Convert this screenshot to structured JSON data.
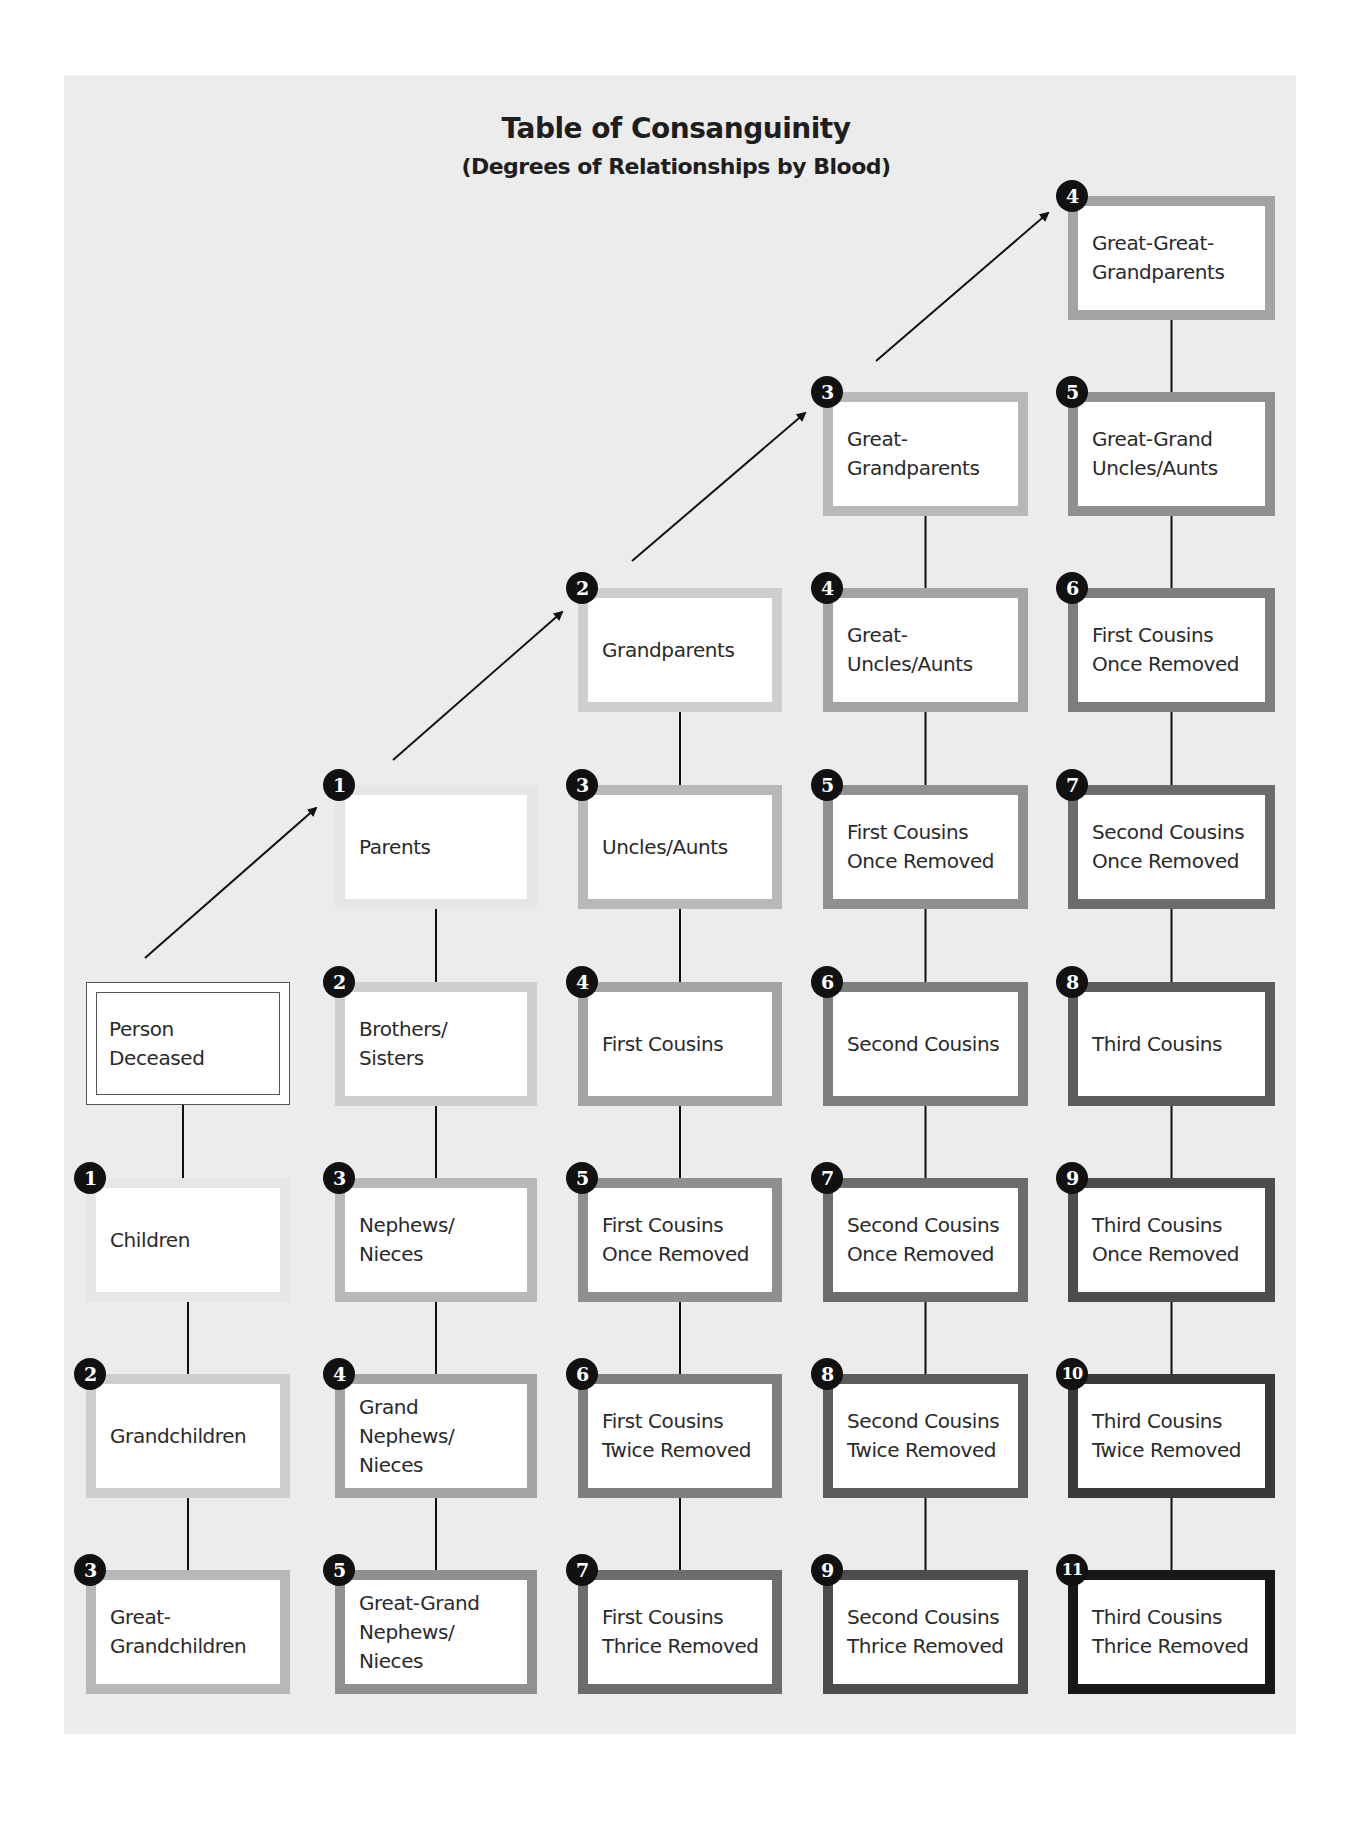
{
  "title": "Table of Consanguinity",
  "subtitle": "(Degrees of Relationships by Blood)",
  "colors": {
    "background": "#ececec",
    "badge": "#111111",
    "degree_shades": {
      "1": "#e6e6e6",
      "2": "#cecece",
      "3": "#b8b8b8",
      "4": "#a4a4a4",
      "5": "#909090",
      "6": "#7e7e7e",
      "7": "#6c6c6c",
      "8": "#5c5c5c",
      "9": "#4c4c4c",
      "10": "#393939",
      "11": "#181818"
    }
  },
  "deceased": {
    "label": "Person\nDeceased"
  },
  "columns": [
    {
      "name": "descendants",
      "nodes": [
        {
          "degree": "1",
          "label": "Children"
        },
        {
          "degree": "2",
          "label": "Grandchildren"
        },
        {
          "degree": "3",
          "label": "Great-\nGrandchildren"
        }
      ]
    },
    {
      "name": "parents-line",
      "nodes": [
        {
          "degree": "1",
          "label": "Parents"
        },
        {
          "degree": "2",
          "label": "Brothers/\nSisters"
        },
        {
          "degree": "3",
          "label": "Nephews/\nNieces"
        },
        {
          "degree": "4",
          "label": "Grand\nNephews/\nNieces"
        },
        {
          "degree": "5",
          "label": "Great-Grand\nNephews/\nNieces"
        }
      ]
    },
    {
      "name": "grandparents-line",
      "nodes": [
        {
          "degree": "2",
          "label": "Grandparents"
        },
        {
          "degree": "3",
          "label": "Uncles/Aunts"
        },
        {
          "degree": "4",
          "label": "First Cousins"
        },
        {
          "degree": "5",
          "label": "First Cousins\nOnce Removed"
        },
        {
          "degree": "6",
          "label": "First Cousins\nTwice Removed"
        },
        {
          "degree": "7",
          "label": "First Cousins\nThrice Removed"
        }
      ]
    },
    {
      "name": "great-grandparents-line",
      "nodes": [
        {
          "degree": "3",
          "label": "Great-\nGrandparents"
        },
        {
          "degree": "4",
          "label": "Great-\nUncles/Aunts"
        },
        {
          "degree": "5",
          "label": "First Cousins\nOnce Removed"
        },
        {
          "degree": "6",
          "label": "Second Cousins"
        },
        {
          "degree": "7",
          "label": "Second Cousins\nOnce Removed"
        },
        {
          "degree": "8",
          "label": "Second Cousins\nTwice Removed"
        },
        {
          "degree": "9",
          "label": "Second Cousins\nThrice Removed"
        }
      ]
    },
    {
      "name": "great-great-grandparents-line",
      "nodes": [
        {
          "degree": "4",
          "label": "Great-Great-\nGrandparents"
        },
        {
          "degree": "5",
          "label": "Great-Grand\nUncles/Aunts"
        },
        {
          "degree": "6",
          "label": "First Cousins\nOnce Removed"
        },
        {
          "degree": "7",
          "label": "Second Cousins\nOnce Removed"
        },
        {
          "degree": "8",
          "label": "Third Cousins"
        },
        {
          "degree": "9",
          "label": "Third Cousins\nOnce Removed"
        },
        {
          "degree": "10",
          "label": "Third Cousins\nTwice Removed"
        },
        {
          "degree": "11",
          "label": "Third Cousins\nThrice Removed"
        }
      ]
    }
  ]
}
